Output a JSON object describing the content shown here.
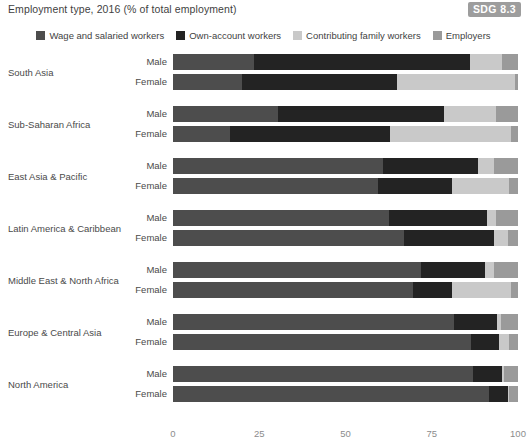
{
  "header": {
    "title": "Employment type, 2016 (% of total employment)",
    "badge": "SDG 8.3"
  },
  "colors": {
    "wage": "#4d4d4d",
    "own_account": "#232323",
    "contributing": "#c9c9c9",
    "employers": "#9a9a9a",
    "text": "#4a4a4a",
    "tick": "#8c8c8c",
    "badge_bg": "#9d9d9d"
  },
  "chart_data": {
    "type": "bar",
    "orientation": "horizontal",
    "stacked": true,
    "stack_total": 100,
    "title": "Employment type, 2016 (% of total employment)",
    "xlabel": "",
    "ylabel": "",
    "xlim": [
      0,
      100
    ],
    "xticks": [
      0,
      25,
      50,
      75,
      100
    ],
    "xtick_labels": [
      "0",
      "25",
      "50",
      "75",
      "100"
    ],
    "grid": false,
    "legend_position": "top-center",
    "legend": [
      "Wage and salaried workers",
      "Own-account workers",
      "Contributing family workers",
      "Employers"
    ],
    "series_keys": [
      "wage",
      "own_account",
      "contributing",
      "employers"
    ],
    "group_labels": [
      "Male",
      "Female"
    ],
    "categories": [
      "South Asia",
      "Sub-Saharan Africa",
      "East Asia & Pacific",
      "Latin America & Caribbean",
      "Middle East & North Africa",
      "Europe & Central Asia",
      "North America"
    ],
    "groups": [
      {
        "category": "South Asia",
        "bars": [
          {
            "label": "Male",
            "wage": 23.5,
            "own_account": 62.5,
            "contributing": 9.5,
            "employers": 4.5
          },
          {
            "label": "Female",
            "wage": 20.0,
            "own_account": 45.0,
            "contributing": 34.0,
            "employers": 1.0
          }
        ]
      },
      {
        "category": "Sub-Saharan Africa",
        "bars": [
          {
            "label": "Male",
            "wage": 30.5,
            "own_account": 48.0,
            "contributing": 15.0,
            "employers": 6.5
          },
          {
            "label": "Female",
            "wage": 16.5,
            "own_account": 46.5,
            "contributing": 35.0,
            "employers": 2.0
          }
        ]
      },
      {
        "category": "East Asia & Pacific",
        "bars": [
          {
            "label": "Male",
            "wage": 61.0,
            "own_account": 27.5,
            "contributing": 4.5,
            "employers": 7.0
          },
          {
            "label": "Female",
            "wage": 59.5,
            "own_account": 21.5,
            "contributing": 16.5,
            "employers": 2.5
          }
        ]
      },
      {
        "category": "Latin America & Caribbean",
        "bars": [
          {
            "label": "Male",
            "wage": 62.5,
            "own_account": 28.5,
            "contributing": 2.5,
            "employers": 6.5
          },
          {
            "label": "Female",
            "wage": 67.0,
            "own_account": 26.0,
            "contributing": 4.0,
            "employers": 3.0
          }
        ]
      },
      {
        "category": "Middle East & North Africa",
        "bars": [
          {
            "label": "Male",
            "wage": 72.0,
            "own_account": 18.5,
            "contributing": 2.5,
            "employers": 7.0
          },
          {
            "label": "Female",
            "wage": 69.5,
            "own_account": 11.5,
            "contributing": 17.0,
            "employers": 2.0
          }
        ]
      },
      {
        "category": "Europe & Central Asia",
        "bars": [
          {
            "label": "Male",
            "wage": 81.5,
            "own_account": 12.5,
            "contributing": 1.0,
            "employers": 5.0
          },
          {
            "label": "Female",
            "wage": 86.5,
            "own_account": 8.0,
            "contributing": 3.0,
            "employers": 2.5
          }
        ]
      },
      {
        "category": "North America",
        "bars": [
          {
            "label": "Male",
            "wage": 87.0,
            "own_account": 8.5,
            "contributing": 0.3,
            "employers": 4.2
          },
          {
            "label": "Female",
            "wage": 91.5,
            "own_account": 5.5,
            "contributing": 0.5,
            "employers": 2.5
          }
        ]
      }
    ]
  }
}
